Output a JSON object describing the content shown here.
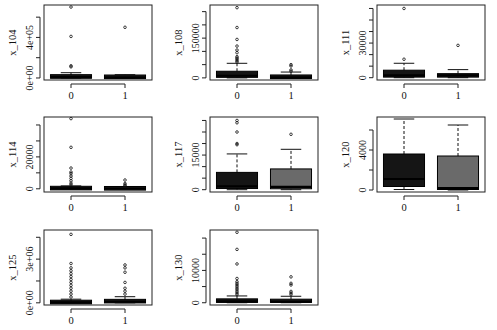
{
  "figure": {
    "layout": "3x3 grid, 8 panels"
  },
  "chart_data": [
    {
      "type": "box",
      "ylabel": "x_104",
      "categories": [
        "0",
        "1"
      ],
      "yticks": [
        {
          "v": 0,
          "label": "0e+00"
        },
        {
          "v": 200000,
          "label": ""
        },
        {
          "v": 400000,
          "label": "4e+05"
        },
        {
          "v": 600000,
          "label": ""
        }
      ],
      "ylim": [
        -20000,
        720000
      ],
      "boxes": [
        {
          "q1": 2000,
          "med": 8000,
          "q3": 28000,
          "lo": 0,
          "hi": 52000,
          "fill": "#151515",
          "out": [
            110000,
            120000,
            410000,
            700000
          ]
        },
        {
          "q1": 1000,
          "med": 6000,
          "q3": 22000,
          "lo": 0,
          "hi": 32000,
          "fill": "#252525",
          "out": [
            500000
          ]
        }
      ]
    },
    {
      "type": "box",
      "ylabel": "x_108",
      "categories": [
        "0",
        "1"
      ],
      "yticks": [
        {
          "v": 0,
          "label": "0"
        },
        {
          "v": 50000,
          "label": ""
        },
        {
          "v": 100000,
          "label": ""
        },
        {
          "v": 150000,
          "label": "150000"
        },
        {
          "v": 200000,
          "label": ""
        },
        {
          "v": 250000,
          "label": ""
        }
      ],
      "ylim": [
        -8000,
        275000
      ],
      "boxes": [
        {
          "q1": 2000,
          "med": 8000,
          "q3": 25000,
          "lo": 0,
          "hi": 55000,
          "fill": "#151515",
          "out": [
            60000,
            65000,
            70000,
            75000,
            80000,
            95000,
            105000,
            120000,
            145000,
            190000,
            265000
          ]
        },
        {
          "q1": 500,
          "med": 2000,
          "q3": 8000,
          "lo": 0,
          "hi": 22000,
          "fill": "#1c1c1c",
          "out": [
            25000,
            30000,
            45000,
            50000
          ]
        }
      ]
    },
    {
      "type": "box",
      "ylabel": "x_111",
      "categories": [
        "0",
        "1"
      ],
      "yticks": [
        {
          "v": 0,
          "label": "0"
        },
        {
          "v": 10000,
          "label": ""
        },
        {
          "v": 20000,
          "label": ""
        },
        {
          "v": 30000,
          "label": "30000"
        },
        {
          "v": 40000,
          "label": ""
        },
        {
          "v": 50000,
          "label": ""
        },
        {
          "v": 60000,
          "label": ""
        }
      ],
      "ylim": [
        -2000,
        63000
      ],
      "boxes": [
        {
          "q1": 500,
          "med": 2000,
          "q3": 6500,
          "lo": 0,
          "hi": 12500,
          "fill": "#151515",
          "out": [
            16000,
            60000
          ]
        },
        {
          "q1": 500,
          "med": 2000,
          "q3": 3500,
          "lo": 0,
          "hi": 7000,
          "fill": "#1c1c1c",
          "out": [
            28000
          ]
        }
      ]
    },
    {
      "type": "box",
      "ylabel": "x_114",
      "categories": [
        "0",
        "1"
      ],
      "yticks": [
        {
          "v": 0,
          "label": "0"
        },
        {
          "v": 10000,
          "label": ""
        },
        {
          "v": 20000,
          "label": "20000"
        },
        {
          "v": 30000,
          "label": ""
        },
        {
          "v": 40000,
          "label": ""
        }
      ],
      "ylim": [
        -2000,
        45000
      ],
      "boxes": [
        {
          "q1": 100,
          "med": 300,
          "q3": 800,
          "lo": 0,
          "hi": 1800,
          "fill": "#151515",
          "out": [
            2500,
            3500,
            5000,
            6500,
            8000,
            9500,
            10500,
            13000,
            26000,
            44000
          ]
        },
        {
          "q1": 50,
          "med": 200,
          "q3": 600,
          "lo": 0,
          "hi": 1300,
          "fill": "#1c1c1c",
          "out": [
            1800,
            2500,
            3300,
            5500
          ]
        }
      ]
    },
    {
      "type": "box",
      "ylabel": "x_117",
      "categories": [
        "0",
        "1"
      ],
      "yticks": [
        {
          "v": 0,
          "label": "0"
        },
        {
          "v": 5000,
          "label": ""
        },
        {
          "v": 10000,
          "label": ""
        },
        {
          "v": 15000,
          "label": "15000"
        },
        {
          "v": 20000,
          "label": ""
        },
        {
          "v": 25000,
          "label": ""
        },
        {
          "v": 30000,
          "label": ""
        }
      ],
      "ylim": [
        -1000,
        31500
      ],
      "boxes": [
        {
          "q1": 500,
          "med": 1500,
          "q3": 7500,
          "lo": 0,
          "hi": 15500,
          "fill": "#151515",
          "out": [
            19500,
            20000,
            25000,
            29000,
            30000
          ]
        },
        {
          "q1": 400,
          "med": 1200,
          "q3": 9000,
          "lo": 0,
          "hi": 17500,
          "fill": "#6a6a6a",
          "out": [
            24000
          ]
        }
      ]
    },
    {
      "type": "box",
      "ylabel": "x_120",
      "categories": [
        "0",
        "1"
      ],
      "yticks": [
        {
          "v": 0,
          "label": "0"
        },
        {
          "v": 2000,
          "label": ""
        },
        {
          "v": 4000,
          "label": "4000"
        },
        {
          "v": 6000,
          "label": ""
        }
      ],
      "ylim": [
        -200,
        7300
      ],
      "boxes": [
        {
          "q1": 350,
          "med": 1100,
          "q3": 3600,
          "lo": 50,
          "hi": 7100,
          "fill": "#151515",
          "out": []
        },
        {
          "q1": 50,
          "med": 200,
          "q3": 3400,
          "lo": 0,
          "hi": 6500,
          "fill": "#6a6a6a",
          "out": []
        }
      ]
    },
    {
      "type": "box",
      "ylabel": "x_125",
      "categories": [
        "0",
        "1"
      ],
      "yticks": [
        {
          "v": 0,
          "label": "0e+00"
        },
        {
          "v": 1500000,
          "label": ""
        },
        {
          "v": 3000000,
          "label": "3e+06"
        },
        {
          "v": 4500000,
          "label": ""
        }
      ],
      "ylim": [
        -150000,
        5000000
      ],
      "boxes": [
        {
          "q1": 10000,
          "med": 30000,
          "q3": 100000,
          "lo": 0,
          "hi": 250000,
          "fill": "#151515",
          "out": [
            400000,
            600000,
            800000,
            1000000,
            1200000,
            1400000,
            1600000,
            1800000,
            2000000,
            2200000,
            2400000,
            2700000,
            4700000
          ]
        },
        {
          "q1": 30000,
          "med": 80000,
          "q3": 200000,
          "lo": 0,
          "hi": 420000,
          "fill": "#1c1c1c",
          "out": [
            600000,
            800000,
            1000000,
            1400000,
            2100000,
            2400000,
            2600000
          ]
        }
      ]
    },
    {
      "type": "box",
      "ylabel": "x_130",
      "categories": [
        "0",
        "1"
      ],
      "yticks": [
        {
          "v": 0,
          "label": "0"
        },
        {
          "v": 5000,
          "label": ""
        },
        {
          "v": 10000,
          "label": "10000"
        },
        {
          "v": 15000,
          "label": ""
        },
        {
          "v": 20000,
          "label": ""
        }
      ],
      "ylim": [
        -700,
        22500
      ],
      "boxes": [
        {
          "q1": 100,
          "med": 400,
          "q3": 1200,
          "lo": 0,
          "hi": 2100,
          "fill": "#151515",
          "out": [
            2500,
            3000,
            3500,
            4000,
            4500,
            5000,
            5500,
            6000,
            6500,
            7500,
            12000,
            16500,
            21800
          ]
        },
        {
          "q1": 100,
          "med": 350,
          "q3": 1100,
          "lo": 0,
          "hi": 2000,
          "fill": "#1c1c1c",
          "out": [
            2500,
            3000,
            3500,
            5500,
            6000,
            8000
          ]
        }
      ]
    }
  ],
  "panels_layout": [
    {
      "x": 44,
      "y": 5,
      "w": 108,
      "h": 75
    },
    {
      "x": 210,
      "y": 5,
      "w": 108,
      "h": 75
    },
    {
      "x": 377,
      "y": 5,
      "w": 108,
      "h": 75
    },
    {
      "x": 44,
      "y": 117,
      "w": 108,
      "h": 75
    },
    {
      "x": 210,
      "y": 117,
      "w": 108,
      "h": 75
    },
    {
      "x": 377,
      "y": 117,
      "w": 108,
      "h": 75
    },
    {
      "x": 44,
      "y": 230,
      "w": 108,
      "h": 75
    },
    {
      "x": 210,
      "y": 230,
      "w": 108,
      "h": 75
    }
  ]
}
